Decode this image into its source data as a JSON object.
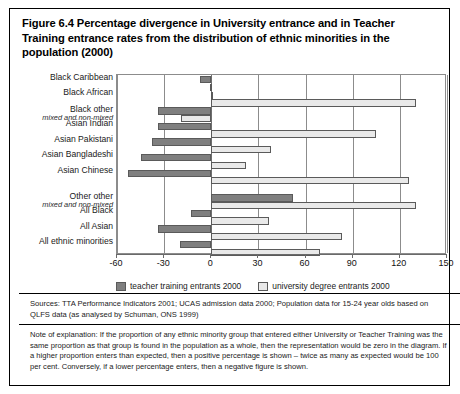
{
  "figure": {
    "title": "Figure 6.4 Percentage divergence in University entrance and in Teacher Training entrance rates from the distribution of ethnic minorities in the population (2000)",
    "sources": "Sources: TTA Performance Indicators 2001; UCAS admission data 2000; Population data for 15-24 year olds based on QLFS data (as analysed by Schuman, ONS 1999)",
    "note": "Note of explanation: If the proportion of any ethnic minority group that entered either University or Teacher Training was the same proportion as that group is found in the population as a whole, then the representation would be zero in the diagram. If a higher proportion enters than expected, then a positive percentage is shown – twice as many as expected would be 100 per cent. Conversely, if a lower percentage enters, then a negative figure is shown."
  },
  "colors": {
    "teacher": "#7f7f7f",
    "university": "#e9e9e9",
    "border": "#5a5a5a",
    "grid": "#8c8c8c"
  },
  "chart_data": {
    "type": "bar",
    "orientation": "horizontal",
    "title": "Figure 6.4 Percentage divergence in University entrance and in Teacher Training entrance rates from the distribution of ethnic minorities in the population (2000)",
    "xlabel": "",
    "ylabel": "",
    "xlim": [
      -60,
      150
    ],
    "xticks": [
      -60,
      -30,
      0,
      30,
      60,
      90,
      120,
      150
    ],
    "xticklabels": [
      "-60",
      "-30",
      "0",
      "30",
      "60",
      "90",
      "120",
      "150"
    ],
    "grid": true,
    "legend_position": "below-axis",
    "categories": [
      "Black Caribbean",
      "Black African",
      "Black other",
      "Asian Indian",
      "Asian Pakistani",
      "Asian Bangladeshi",
      "Asian Chinese",
      "Other other",
      "All Black",
      "All Asian",
      "All ethnic minorities"
    ],
    "category_sublabels": [
      "",
      "",
      "mixed and non-mixed",
      "",
      "",
      "",
      "",
      "mixed and non-mixed",
      "",
      "",
      ""
    ],
    "series": [
      {
        "name": "teacher training entrants 2000",
        "color": "#7f7f7f",
        "values": [
          -7,
          0,
          -34,
          -34,
          -38,
          -45,
          -53,
          52,
          -13,
          -34,
          -20
        ]
      },
      {
        "name": "university degree entrants 2000",
        "color": "#e9e9e9",
        "values": [
          -1,
          130,
          -19,
          105,
          38,
          22,
          126,
          130,
          37,
          83,
          69
        ]
      }
    ]
  }
}
